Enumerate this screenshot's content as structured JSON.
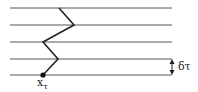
{
  "diagram": {
    "lines_y": [
      8,
      25,
      42,
      59,
      75
    ],
    "line_x_start": 10,
    "line_x_end": 172,
    "path": [
      [
        59,
        8
      ],
      [
        74,
        25
      ],
      [
        43,
        42
      ],
      [
        58,
        59
      ],
      [
        43,
        75
      ]
    ],
    "start_point": [
      43,
      75
    ],
    "start_label": "x",
    "start_label_sub": "τ",
    "interval_label": "δτ",
    "stroke_color": "#333333"
  }
}
